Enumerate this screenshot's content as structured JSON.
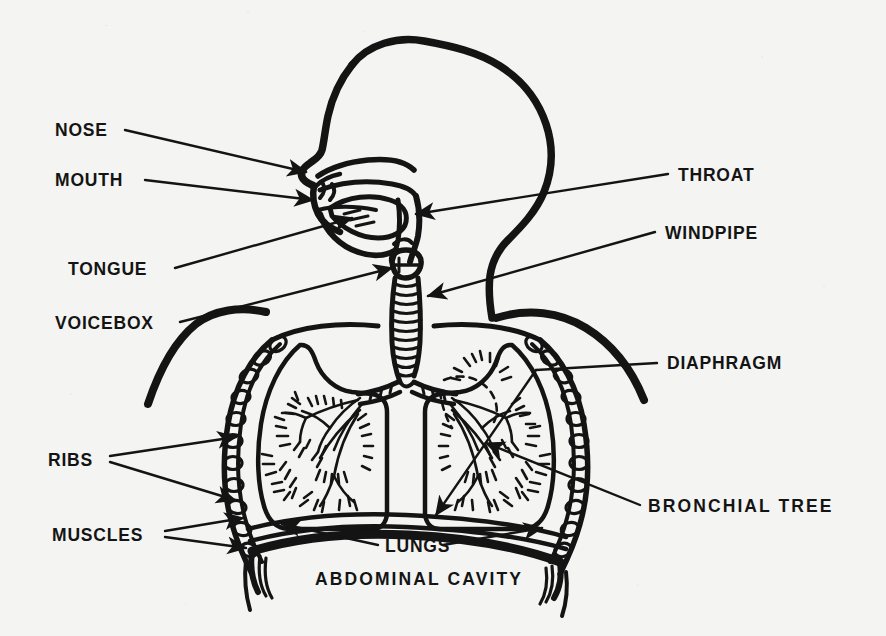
{
  "figure": {
    "kind": "anatomical-line-diagram",
    "background_color": "#f4f4f3",
    "ink_color": "#141414"
  },
  "labels": {
    "nose": "NOSE",
    "mouth": "MOUTH",
    "tongue": "TONGUE",
    "voicebox": "VOICEBOX",
    "ribs": "RIBS",
    "muscles": "MUSCLES",
    "throat": "THROAT",
    "windpipe": "WINDPIPE",
    "diaphragm": "DIAPHRAGM",
    "bronchial_tree": "BRONCHIAL TREE",
    "lungs": "LUNGS",
    "abdominal_cavity": "ABDOMINAL CAVITY"
  },
  "label_layout": [
    {
      "key": "nose",
      "text": "NOSE",
      "x": 55,
      "y": 136,
      "side": "left",
      "arrows": 1
    },
    {
      "key": "mouth",
      "text": "MOUTH",
      "x": 55,
      "y": 185,
      "side": "left",
      "arrows": 1
    },
    {
      "key": "tongue",
      "text": "TONGUE",
      "x": 68,
      "y": 275,
      "side": "left",
      "arrows": 1
    },
    {
      "key": "voicebox",
      "text": "VOICEBOX",
      "x": 55,
      "y": 327,
      "side": "left",
      "arrows": 1
    },
    {
      "key": "ribs",
      "text": "RIBS",
      "x": 48,
      "y": 465,
      "side": "left",
      "arrows": 2
    },
    {
      "key": "muscles",
      "text": "MUSCLES",
      "x": 52,
      "y": 538,
      "side": "left",
      "arrows": 2
    },
    {
      "key": "throat",
      "text": "THROAT",
      "x": 678,
      "y": 180,
      "side": "right",
      "arrows": 1
    },
    {
      "key": "windpipe",
      "text": "WINDPIPE",
      "x": 665,
      "y": 238,
      "side": "right",
      "arrows": 1
    },
    {
      "key": "diaphragm",
      "text": "DIAPHRAGM",
      "x": 665,
      "y": 368,
      "side": "right",
      "arrows": 1
    },
    {
      "key": "bronchial_tree",
      "text": "BRONCHIAL TREE",
      "x": 648,
      "y": 511,
      "side": "right",
      "arrows": 1
    },
    {
      "key": "lungs",
      "text": "LUNGS",
      "x": 385,
      "y": 551,
      "side": "bottom",
      "arrows": 2
    },
    {
      "key": "abdominal_cavity",
      "text": "ABDOMINAL CAVITY",
      "x": 315,
      "y": 584,
      "side": "bottom",
      "arrows": 0
    }
  ],
  "structures": [
    "head-profile",
    "nasal-cavity",
    "oral-cavity",
    "tongue",
    "throat-pharynx",
    "voicebox-larynx",
    "windpipe-trachea",
    "left-lung",
    "right-lung",
    "bronchial-tree-left",
    "bronchial-tree-right",
    "ribs",
    "chest-muscles",
    "diaphragm",
    "abdominal-cavity",
    "shoulders"
  ]
}
